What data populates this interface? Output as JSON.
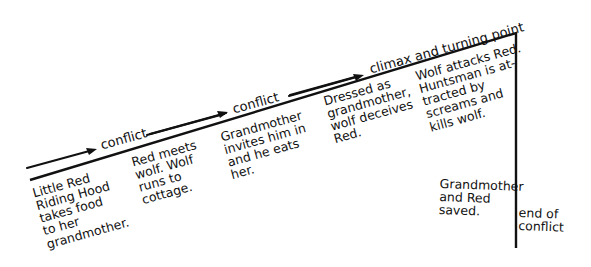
{
  "diagram": {
    "type": "plot-structure-diagram",
    "line_color": "#111111",
    "background": "#ffffff",
    "arrow_labels": [
      {
        "id": "conflict-1",
        "text": "conflict"
      },
      {
        "id": "conflict-2",
        "text": "conflict"
      },
      {
        "id": "climax",
        "text": "climax and turning point"
      }
    ],
    "stages": [
      {
        "id": "exposition",
        "text": "Little Red\nRiding Hood\ntakes food\nto her\ngrandmother."
      },
      {
        "id": "rising-1",
        "text": "Red meets\nwolf. Wolf\nruns to\ncottage."
      },
      {
        "id": "rising-2",
        "text": "Grandmother\ninvites him in\nand he eats\nher."
      },
      {
        "id": "rising-3",
        "text": "Dressed as\ngrandmother,\nwolf deceives\nRed."
      },
      {
        "id": "climax",
        "text": "Wolf attacks Red.\nHuntsman is at-\ntracted by\nscreams and\nkills wolf."
      },
      {
        "id": "resolution",
        "text": "Grandmother\nand Red\nsaved."
      }
    ],
    "end_label": "end of\nconflict"
  }
}
